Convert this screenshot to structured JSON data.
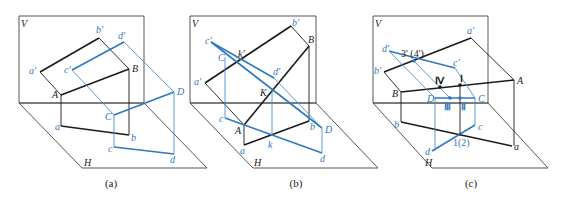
{
  "figure": {
    "colors": {
      "line": "#1a1a1a",
      "accent": "#2f78c0",
      "plane": "#444444"
    },
    "panels": [
      {
        "id": "a",
        "caption": "(a)",
        "plane_labels": {
          "V": "V",
          "H": "H"
        },
        "labels": {
          "a_prime": "a'",
          "b_prime": "b'",
          "A": "A",
          "B": "B",
          "a": "a",
          "b": "b",
          "c_prime": "c'",
          "d_prime": "d'",
          "C": "C",
          "D": "D",
          "c": "c",
          "d": "d"
        }
      },
      {
        "id": "b",
        "caption": "(b)",
        "plane_labels": {
          "V": "V",
          "H": "H"
        },
        "labels": {
          "a_prime": "a'",
          "b_prime": "b'",
          "A": "A",
          "B": "B",
          "a": "a",
          "b": "b",
          "c_prime": "c'",
          "d_prime": "d'",
          "C": "C",
          "D": "D",
          "c": "c",
          "d": "d",
          "k_prime": "k'",
          "K": "K",
          "k": "k"
        }
      },
      {
        "id": "c",
        "caption": "(c)",
        "plane_labels": {
          "V": "V",
          "H": "H"
        },
        "labels": {
          "a_prime": "a'",
          "b_prime": "b'",
          "A": "A",
          "B": "B",
          "a": "a",
          "b": "b",
          "c_prime": "c'",
          "d_prime": "d'",
          "C": "C",
          "D": "D",
          "c": "c",
          "d": "d",
          "p3_4_prime": "3' (4')",
          "I": "Ⅰ",
          "II": "Ⅱ",
          "III": "Ⅲ",
          "IV": "Ⅳ",
          "p1_2": "1(2)"
        }
      }
    ]
  }
}
